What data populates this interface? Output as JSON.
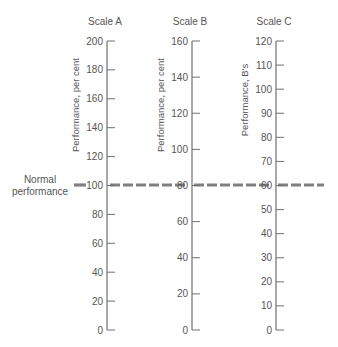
{
  "chart_data": {
    "type": "diagram",
    "title": "",
    "normal_performance_label": [
      "Normal",
      "performance"
    ],
    "normal_line_color": "#808080",
    "axis_color": "#707070",
    "text_color": "#555555",
    "scales": [
      {
        "name": "Scale A",
        "axis_label": "Performance, per cent",
        "min": 0,
        "max": 200,
        "step": 20,
        "ticks": [
          0,
          20,
          40,
          60,
          80,
          100,
          120,
          140,
          160,
          180,
          200
        ],
        "normal_value": 100
      },
      {
        "name": "Scale B",
        "axis_label": "Performance, per cent",
        "min": 0,
        "max": 160,
        "step": 20,
        "ticks": [
          0,
          20,
          40,
          60,
          80,
          100,
          120,
          140,
          160
        ],
        "normal_value": 80
      },
      {
        "name": "Scale C",
        "axis_label": "Performance, B's",
        "min": 0,
        "max": 120,
        "step": 10,
        "ticks": [
          0,
          10,
          20,
          30,
          40,
          50,
          60,
          70,
          80,
          90,
          100,
          110,
          120
        ],
        "normal_value": 60
      }
    ]
  }
}
